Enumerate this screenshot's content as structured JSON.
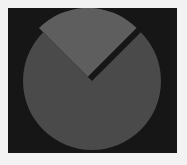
{
  "figure": {
    "title": "",
    "canvas_width": 187,
    "canvas_height": 165,
    "outer_background_color": "#f2f2f2",
    "panel_background_color": "#161616",
    "panel_left": 8,
    "panel_top": 8,
    "panel_width": 169,
    "panel_height": 145
  },
  "chart_data": {
    "type": "pie",
    "title": "",
    "xlabel": "",
    "ylabel": "",
    "legend": [],
    "legend_position": "none",
    "grid": false,
    "labels": [
      "",
      ""
    ],
    "values": [
      75,
      25
    ],
    "percentages": [
      75,
      25
    ],
    "colors": [
      "#4a4a4a",
      "#5e5e5e"
    ],
    "explode": [
      0,
      0.06
    ],
    "start_angle_deg": 135,
    "counterclock": false,
    "center_x": 92,
    "center_y": 81,
    "radius": 69,
    "slice_gap_color": "#161616",
    "slices": [
      {
        "name": "slice-major",
        "value": 75,
        "percent": 75,
        "color": "#4a4a4a",
        "start_angle_deg": 135,
        "end_angle_deg": 405,
        "exploded": false,
        "offset_x": 0,
        "offset_y": 0
      },
      {
        "name": "slice-minor",
        "value": 25,
        "percent": 25,
        "color": "#5e5e5e",
        "start_angle_deg": 45,
        "end_angle_deg": 135,
        "exploded": true,
        "offset_x": -4.2,
        "offset_y": -4.2
      }
    ]
  }
}
